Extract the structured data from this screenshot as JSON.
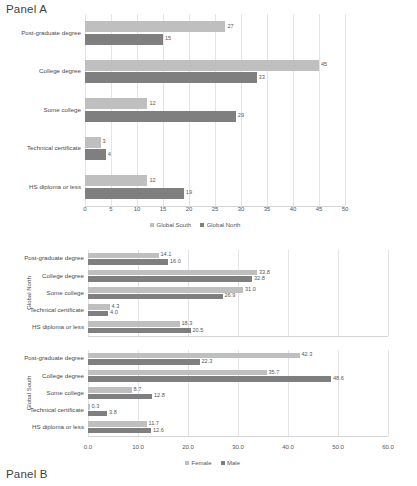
{
  "panelA": {
    "title": "Panel A",
    "legend": [
      "Global South",
      "Global North"
    ],
    "axis_ticks": [
      "0",
      "5",
      "10",
      "15",
      "20",
      "25",
      "30",
      "35",
      "40",
      "45",
      "50"
    ]
  },
  "panelB": {
    "title": "Panel B",
    "legend": [
      "Female",
      "Male"
    ],
    "axis_ticks": [
      "0.0",
      "10.0",
      "20.0",
      "30.0",
      "40.0",
      "50.0",
      "60.0"
    ],
    "group_north": "Global North",
    "group_south": "Global South"
  },
  "chart_data": [
    {
      "type": "bar",
      "title": "Panel A",
      "orientation": "horizontal",
      "grouped": true,
      "categories": [
        "Post-graduate degree",
        "College degree",
        "Some college",
        "Technical certificate",
        "HS diploma or less"
      ],
      "series": [
        {
          "name": "Global South",
          "values": [
            27,
            45,
            12,
            3,
            12
          ]
        },
        {
          "name": "Global North",
          "values": [
            15,
            33,
            29,
            4,
            19
          ]
        }
      ],
      "xlabel": "",
      "ylabel": "",
      "xlim": [
        0,
        50
      ],
      "xticks": [
        0,
        5,
        10,
        15,
        20,
        25,
        30,
        35,
        40,
        45,
        50
      ],
      "grid": true,
      "legend_position": "bottom",
      "data_labels": true,
      "label_precision": 0
    },
    {
      "type": "bar",
      "title": "Panel B - Global North",
      "orientation": "horizontal",
      "grouped": true,
      "group": "Global North",
      "categories": [
        "Post-graduate degree",
        "College degree",
        "Some college",
        "Technical certificate",
        "HS diploma or less"
      ],
      "series": [
        {
          "name": "Female",
          "values": [
            14.1,
            33.8,
            31.0,
            4.3,
            18.3
          ]
        },
        {
          "name": "Male",
          "values": [
            16.0,
            32.8,
            26.9,
            4.0,
            20.5
          ]
        }
      ],
      "xlabel": "",
      "ylabel": "Global North",
      "xlim": [
        0,
        60
      ],
      "xticks": [
        0,
        10,
        20,
        30,
        40,
        50,
        60
      ],
      "grid": true,
      "legend_position": "bottom",
      "data_labels": true,
      "label_precision": 1
    },
    {
      "type": "bar",
      "title": "Panel B - Global South",
      "orientation": "horizontal",
      "grouped": true,
      "group": "Global South",
      "categories": [
        "Post-graduate degree",
        "College degree",
        "Some college",
        "Technical certificate",
        "HS diploma or less"
      ],
      "series": [
        {
          "name": "Female",
          "values": [
            42.3,
            35.7,
            8.7,
            0.3,
            11.7
          ]
        },
        {
          "name": "Male",
          "values": [
            22.3,
            48.6,
            12.8,
            3.8,
            12.6
          ]
        }
      ],
      "xlabel": "",
      "ylabel": "Global South",
      "xlim": [
        0,
        60
      ],
      "xticks": [
        0,
        10,
        20,
        30,
        40,
        50,
        60
      ],
      "grid": true,
      "legend_position": "bottom",
      "data_labels": true,
      "label_precision": 1
    }
  ],
  "colors": {
    "series_light": "#bfbfbf",
    "series_dark": "#7f7f7f",
    "grid": "#e4e4e4",
    "text": "#4a4a4a"
  }
}
